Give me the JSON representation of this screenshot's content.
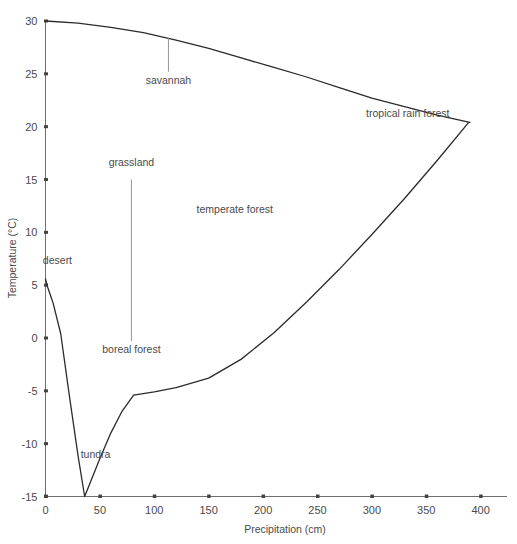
{
  "chart_data": {
    "type": "line",
    "title": "",
    "xlabel": "Precipitation  (cm)",
    "ylabel": "Temperature  (°C)",
    "xlim": [
      0,
      415
    ],
    "ylim": [
      -15,
      30
    ],
    "grid": false,
    "legend": "none",
    "x_ticks": [
      {
        "value": 0,
        "label": "0"
      },
      {
        "value": 50,
        "label": "50"
      },
      {
        "value": 100,
        "label": "100"
      },
      {
        "value": 150,
        "label": "150"
      },
      {
        "value": 200,
        "label": "200"
      },
      {
        "value": 250,
        "label": "250"
      },
      {
        "value": 300,
        "label": "300"
      },
      {
        "value": 350,
        "label": "350"
      },
      {
        "value": 400,
        "label": "400"
      }
    ],
    "y_ticks": [
      {
        "value": 30,
        "label": "30"
      },
      {
        "value": 25,
        "label": "25"
      },
      {
        "value": 20,
        "label": "20"
      },
      {
        "value": 15,
        "label": "15"
      },
      {
        "value": 10,
        "label": "10"
      },
      {
        "value": 5,
        "label": "5"
      },
      {
        "value": 0,
        "label": "0"
      },
      {
        "value": -5,
        "label": "-5"
      },
      {
        "value": -10,
        "label": "-10"
      },
      {
        "value": -15,
        "label": "-15"
      }
    ],
    "series": [
      {
        "name": "biome envelope",
        "color": "#2b2b2b",
        "points": [
          [
            0,
            30.0
          ],
          [
            30,
            29.8
          ],
          [
            60,
            29.4
          ],
          [
            90,
            28.9
          ],
          [
            120,
            28.2
          ],
          [
            150,
            27.4
          ],
          [
            180,
            26.5
          ],
          [
            210,
            25.6
          ],
          [
            240,
            24.7
          ],
          [
            270,
            23.7
          ],
          [
            300,
            22.7
          ],
          [
            330,
            21.9
          ],
          [
            360,
            21.1
          ],
          [
            390,
            20.4
          ],
          [
            389,
            20.4
          ],
          [
            360,
            16.8
          ],
          [
            330,
            13.2
          ],
          [
            300,
            9.8
          ],
          [
            270,
            6.5
          ],
          [
            240,
            3.4
          ],
          [
            210,
            0.5
          ],
          [
            180,
            -2.0
          ],
          [
            150,
            -3.8
          ],
          [
            120,
            -4.7
          ],
          [
            100,
            -5.1
          ],
          [
            81,
            -5.4
          ],
          [
            70,
            -7.0
          ],
          [
            60,
            -9.0
          ],
          [
            50,
            -11.4
          ],
          [
            36,
            -15.0
          ],
          [
            30,
            -11.2
          ],
          [
            22,
            -5.5
          ],
          [
            14,
            0.4
          ],
          [
            7,
            3.3
          ],
          [
            2,
            4.8
          ],
          [
            0,
            5.6
          ]
        ]
      }
    ],
    "annotations": [
      {
        "id": "savannah",
        "label": "savannah",
        "label_x": 113,
        "label_y": 24.0,
        "leader_from": [
          113,
          28.4
        ],
        "leader_to": [
          113,
          25.2
        ]
      },
      {
        "id": "grassland",
        "label": "grassland",
        "label_x": 79,
        "label_y": 16.3,
        "leader_from": [
          79,
          15.0
        ],
        "leader_to": [
          79,
          -0.3
        ]
      },
      {
        "id": "boreal-forest",
        "label": "boreal forest",
        "label_x": 79,
        "label_y": -1.4,
        "leader_from": null,
        "leader_to": null
      },
      {
        "id": "temperate-forest",
        "label": "temperate forest",
        "label_x": 174,
        "label_y": 11.8,
        "leader_from": null,
        "leader_to": null
      },
      {
        "id": "desert",
        "label": "desert",
        "label_x": 11,
        "label_y": 7.0,
        "leader_from": null,
        "leader_to": null
      },
      {
        "id": "tundra",
        "label": "tundra",
        "label_x": 46,
        "label_y": -11.4,
        "leader_from": null,
        "leader_to": null
      },
      {
        "id": "tropical-rain-forest",
        "label": "tropical rain forest",
        "label_x": 333,
        "label_y": 20.9,
        "leader_from": null,
        "leader_to": null
      }
    ]
  },
  "colors": {
    "curve": "#2b2b2b",
    "axis": "#6e6e6e",
    "text": "#4a4a4a",
    "background": "#ffffff"
  }
}
